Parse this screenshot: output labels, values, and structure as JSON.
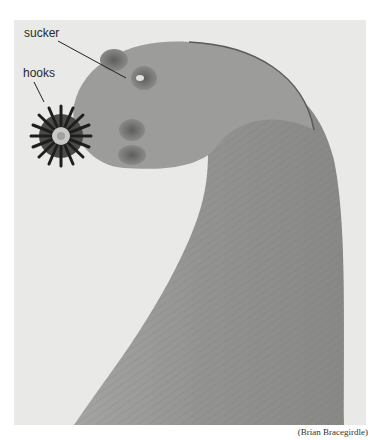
{
  "figure": {
    "labels": {
      "sucker": "sucker",
      "hooks": "hooks"
    },
    "credit": "(Brian Bracegirdle)",
    "colors": {
      "background": "#e9e9e7",
      "body": "#9a9a98",
      "body_dark": "#7e7e7c",
      "hooks": "#1e1e1e",
      "sucker": "#6c6c6a"
    }
  }
}
